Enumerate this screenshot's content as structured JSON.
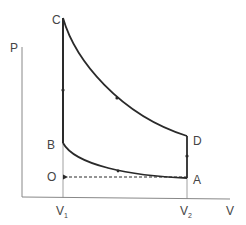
{
  "diagram": {
    "type": "pv-diagram",
    "axes": {
      "y_label": "P",
      "x_label": "V",
      "x_ticks": [
        {
          "main": "V",
          "sub": "1"
        },
        {
          "main": "V",
          "sub": "2"
        }
      ]
    },
    "points": {
      "A": "A",
      "B": "B",
      "C": "C",
      "D": "D",
      "O": "O"
    },
    "colors": {
      "curve": "#2a2a2a",
      "axis": "#888888",
      "label": "#444444"
    }
  }
}
